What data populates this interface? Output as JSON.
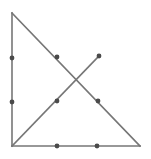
{
  "figure": {
    "canvas": {
      "width": 151,
      "height": 159,
      "background": "#ffffff"
    },
    "style": {
      "line_color": "#767676",
      "line_width": 1.6,
      "point_color": "#4a4a4a",
      "point_size": 2.4
    },
    "vertices": {
      "top_left": {
        "label": "top-vertex",
        "x": 12,
        "y": 13
      },
      "bottom_left": {
        "label": "bottom-left-vertex",
        "x": 12,
        "y": 146
      },
      "bottom_right": {
        "label": "bottom-right-vertex",
        "x": 140,
        "y": 146
      },
      "ray_end": {
        "label": "upper-right-ray-endpoint",
        "x": 99,
        "y": 56
      }
    },
    "segments": [
      {
        "name": "left-leg",
        "x1": 12,
        "y1": 13,
        "x2": 12,
        "y2": 146
      },
      {
        "name": "bottom-leg",
        "x1": 12,
        "y1": 146,
        "x2": 140,
        "y2": 146
      },
      {
        "name": "hypotenuse",
        "x1": 12,
        "y1": 13,
        "x2": 140,
        "y2": 146
      },
      {
        "name": "ascending-segment",
        "x1": 12,
        "y1": 146,
        "x2": 99,
        "y2": 56
      }
    ],
    "marked_points": [
      {
        "name": "left-leg-point-upper",
        "x": 12,
        "y": 58
      },
      {
        "name": "left-leg-point-lower",
        "x": 12,
        "y": 102
      },
      {
        "name": "bottom-leg-point-left",
        "x": 57,
        "y": 146
      },
      {
        "name": "bottom-leg-point-right",
        "x": 97,
        "y": 146
      },
      {
        "name": "hypotenuse-point-upper",
        "x": 57,
        "y": 57
      },
      {
        "name": "hypotenuse-point-lower",
        "x": 98,
        "y": 101
      },
      {
        "name": "ascending-segment-point",
        "x": 57,
        "y": 101
      },
      {
        "name": "ascending-segment-endpoint",
        "x": 99,
        "y": 56
      }
    ],
    "intersection": {
      "name": "segments-intersection",
      "x": 78,
      "y": 79
    }
  }
}
